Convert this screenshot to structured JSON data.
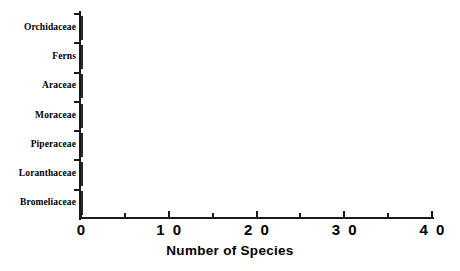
{
  "chart_data": {
    "type": "bar",
    "orientation": "horizontal",
    "title": "",
    "xlabel": "Number of Species",
    "ylabel": "",
    "categories": [
      "Orchidaceae",
      "Ferns",
      "Araceae",
      "Moraceae",
      "Piperaceae",
      "Loranthaceae",
      "Bromeliaceae"
    ],
    "values": [
      38,
      32,
      29,
      10,
      10,
      9,
      6
    ],
    "xlim": [
      0,
      40
    ],
    "xticks": [
      0,
      10,
      20,
      30,
      40
    ],
    "xtick_labels": [
      "0",
      "1 0",
      "2 0",
      "3 0",
      "4 0"
    ],
    "xminorticks": [
      5,
      15,
      25,
      35
    ],
    "grid": false,
    "legend": false,
    "bar_fill_color": "#a8a8a8",
    "bar_edge_color": "#2a2a2a",
    "background_color": "#ffffff",
    "axis_color": "#1a1a1a"
  },
  "axis": {
    "x_title": "Number of Species"
  }
}
